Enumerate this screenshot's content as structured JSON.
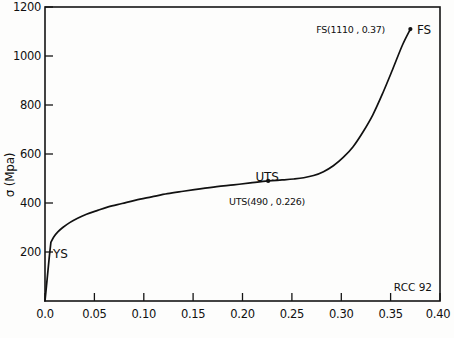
{
  "chart_data": {
    "type": "line",
    "title": "",
    "xlabel": "",
    "ylabel": "σ (Mpa)",
    "xlim": [
      0.0,
      0.4
    ],
    "ylim": [
      0,
      1200
    ],
    "grid": false,
    "legend": "none",
    "x_ticks": [
      "0.0",
      "0.05",
      "0.10",
      "0.15",
      "0.20",
      "0.25",
      "0.30",
      "0.35",
      "0.40"
    ],
    "x_tick_values": [
      0.0,
      0.05,
      0.1,
      0.15,
      0.2,
      0.25,
      0.3,
      0.35,
      0.4
    ],
    "y_ticks": [
      "200",
      "400",
      "600",
      "800",
      "1000",
      "1200"
    ],
    "y_tick_values": [
      200,
      400,
      600,
      800,
      1000,
      1200
    ],
    "series": [
      {
        "name": "stress-strain",
        "x": [
          0.0,
          0.0015,
          0.003,
          0.0045,
          0.006,
          0.009,
          0.013,
          0.018,
          0.025,
          0.033,
          0.042,
          0.052,
          0.064,
          0.078,
          0.092,
          0.108,
          0.124,
          0.14,
          0.157,
          0.174,
          0.191,
          0.208,
          0.226,
          0.24,
          0.252,
          0.262,
          0.272,
          0.282,
          0.292,
          0.302,
          0.312,
          0.322,
          0.332,
          0.342,
          0.352,
          0.362,
          0.37
        ],
        "y": [
          0,
          62,
          124,
          186,
          240,
          262,
          282,
          300,
          320,
          338,
          354,
          368,
          384,
          398,
          412,
          425,
          438,
          448,
          458,
          467,
          474,
          482,
          490,
          494,
          498,
          503,
          512,
          528,
          552,
          586,
          630,
          690,
          760,
          848,
          945,
          1045,
          1110
        ]
      }
    ],
    "annotations": [
      {
        "id": "ys",
        "label": "YS",
        "x": 0.006,
        "y": 240,
        "marker": false
      },
      {
        "id": "uts",
        "label": "UTS",
        "x": 0.226,
        "y": 490,
        "marker": true
      },
      {
        "id": "uts_value",
        "label": "UTS(490 , 0.226)",
        "x": 0.226,
        "y": 490,
        "marker": false
      },
      {
        "id": "fs_value",
        "label": "FS(1110 , 0.37)",
        "x": 0.37,
        "y": 1110,
        "marker": false
      },
      {
        "id": "fs",
        "label": "FS",
        "x": 0.37,
        "y": 1110,
        "marker": true
      }
    ],
    "stamp": "RCC  92"
  },
  "axis": {
    "y_title": "σ (Mpa)",
    "y_labels": {
      "t1200": "1200",
      "t1000": "1000",
      "t800": "800",
      "t600": "600",
      "t400": "400",
      "t200": "200"
    },
    "x_labels": {
      "t000": "0.0",
      "t005": "0.05",
      "t010": "0.10",
      "t015": "0.15",
      "t020": "0.20",
      "t025": "0.25",
      "t030": "0.30",
      "t035": "0.35",
      "t040": "0.40"
    }
  },
  "annotations": {
    "ys_label": "YS",
    "uts_label": "UTS",
    "uts_value_label": "UTS(490 , 0.226)",
    "fs_value_label": "FS(1110 , 0.37)",
    "fs_label": "FS",
    "stamp_label": "RCC  92"
  },
  "caption": {
    "text": ""
  }
}
